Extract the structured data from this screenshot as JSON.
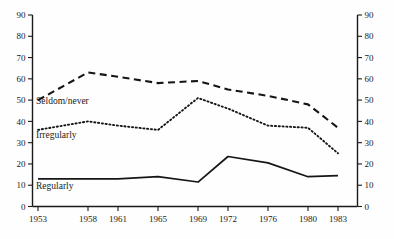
{
  "chart_data": {
    "type": "line",
    "title": "",
    "subtitle": "",
    "xlabel": "",
    "ylabel": "",
    "x": [
      1953,
      1958,
      1961,
      1965,
      1969,
      1972,
      1976,
      1980,
      1983
    ],
    "categories": [
      "1953",
      "1958",
      "1961",
      "1965",
      "1969",
      "1972",
      "1976",
      "1980",
      "1983"
    ],
    "xtick_labels": [
      "1953",
      "1958",
      "1961",
      "1965",
      "1969",
      "1972",
      "1976",
      "1980",
      "1983"
    ],
    "ytick_labels": [
      "0",
      "10",
      "20",
      "30",
      "40",
      "50",
      "60",
      "70",
      "80",
      "90"
    ],
    "ytick_values": [
      0,
      10,
      20,
      30,
      40,
      50,
      60,
      70,
      80,
      90
    ],
    "ylim": [
      0,
      90
    ],
    "xlim": [
      1953,
      1983
    ],
    "grid": false,
    "legend_position": "inline-left",
    "right_axis_mirrored": true,
    "right_ytick_labels": [
      "0",
      "10",
      "20",
      "30",
      "40",
      "50",
      "60",
      "70",
      "80",
      "90"
    ],
    "series": [
      {
        "name": "Seldom/never",
        "style": "dashed",
        "color": "#161616",
        "label_text": "Seldom/never",
        "values": [
          50,
          63,
          61,
          58,
          59,
          55,
          52,
          48,
          37
        ]
      },
      {
        "name": "Irregularly",
        "style": "dotted",
        "color": "#161616",
        "label_text": "Irregularly",
        "values": [
          36,
          40,
          38,
          36,
          51,
          46,
          38,
          37,
          25
        ]
      },
      {
        "name": "Regularly",
        "style": "solid",
        "color": "#161616",
        "label_text": "Regularly",
        "values": [
          13,
          13,
          13,
          14,
          11.5,
          23.5,
          20.5,
          14,
          14.5
        ]
      }
    ]
  },
  "axes": {
    "left_ticks": [
      "90",
      "80",
      "70",
      "60",
      "50",
      "40",
      "30",
      "20",
      "10",
      "0"
    ],
    "right_ticks": [
      "90",
      "80",
      "70",
      "60",
      "50",
      "40",
      "30",
      "20",
      "10",
      "0"
    ],
    "x_ticks": [
      "1953",
      "1958",
      "1961",
      "1965",
      "1969",
      "1972",
      "1976",
      "1980",
      "1983"
    ]
  },
  "labels": {
    "seldom_never": "Seldom/never",
    "irregularly": "Irregularly",
    "regularly": "Regularly"
  },
  "colors": {
    "ink": "#161616",
    "background": "#fefefe"
  }
}
